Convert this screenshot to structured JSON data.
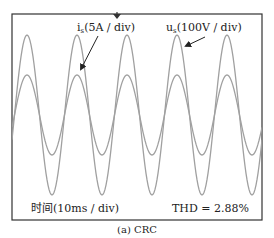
{
  "chart_data": {
    "type": "line",
    "title": "(a) CRC",
    "xlabel": "时间(10ms / div)",
    "ylabel": "",
    "grid": false,
    "legend": "inline annotations with arrows",
    "annotations": [
      {
        "text": "THD = 2.88%",
        "position": "bottom-right"
      },
      {
        "text": "时间(10ms / div)",
        "position": "bottom-left"
      }
    ],
    "series": [
      {
        "name": "u_s (100V / div)",
        "label_main": "u",
        "label_sub": "s",
        "label_rest": "(100V / div)",
        "waveform": "sine",
        "amplitude_px": 80,
        "peak_positions_x_px": [
          27,
          77,
          127,
          177,
          227
        ],
        "period_ms": 20,
        "cycles_visible": 5,
        "color": "#9a9a9a"
      },
      {
        "name": "i_s (5A / div)",
        "label_main": "i",
        "label_sub": "s",
        "label_rest": "(5A / div)",
        "waveform": "sine (in phase with u_s)",
        "amplitude_px": 40,
        "peak_positions_x_px": [
          27,
          77,
          127,
          177,
          227
        ],
        "period_ms": 20,
        "cycles_visible": 5,
        "color": "#9a9a9a"
      }
    ],
    "thd": "2.88%",
    "time_per_div": "10ms / div",
    "trigger_marker_x_px": 117
  },
  "labels": {
    "is_main": "i",
    "is_sub": "s",
    "is_rest": "(5A / div)",
    "us_main": "u",
    "us_sub": "s",
    "us_rest": "(100V / div)",
    "time": "时间(10ms / div)",
    "thd": "THD = 2.88%",
    "caption": "(a) CRC"
  },
  "colors": {
    "frame": "#333333",
    "trace": "#a0a0a0",
    "text": "#222222",
    "arrow": "#222222"
  }
}
